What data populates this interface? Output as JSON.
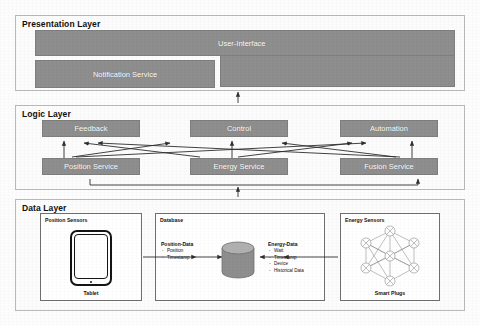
{
  "diagram": {
    "colors": {
      "box_fill": "#8e8e8e",
      "box_text": "#ffffff",
      "layer_bg": "#fcfcfc",
      "layer_border": "#b9b9b9",
      "line": "#3a3a3a",
      "page_bg": "#fdfdfd"
    }
  },
  "presentation_layer": {
    "title": "Presentation Layer",
    "boxes": [
      {
        "label": "User-Interface"
      },
      {
        "label": "Notification Service"
      }
    ]
  },
  "logic_layer": {
    "title": "Logic Layer",
    "top_row": [
      {
        "label": "Feedback"
      },
      {
        "label": "Control"
      },
      {
        "label": "Automation"
      }
    ],
    "bottom_row": [
      {
        "label": "Position Service"
      },
      {
        "label": "Energy Service"
      },
      {
        "label": "Fusion Service"
      }
    ]
  },
  "data_layer": {
    "title": "Data Layer",
    "groups": [
      {
        "label": "Position Sensors",
        "caption": "Tablet",
        "device_icon": "tablet-icon"
      },
      {
        "label": "Database",
        "icon": "database-cylinder-icon",
        "lists": [
          {
            "title": "Position-Data",
            "items": [
              "Position",
              "Timestamp"
            ]
          },
          {
            "title": "Energy-Data",
            "items": [
              "Watt",
              "Timestamp",
              "Device",
              "Historical Data"
            ]
          }
        ]
      },
      {
        "label": "Energy Sensors",
        "caption": "Smart Plugs",
        "icon": "mesh-network-icon",
        "node_count": 7
      }
    ]
  }
}
